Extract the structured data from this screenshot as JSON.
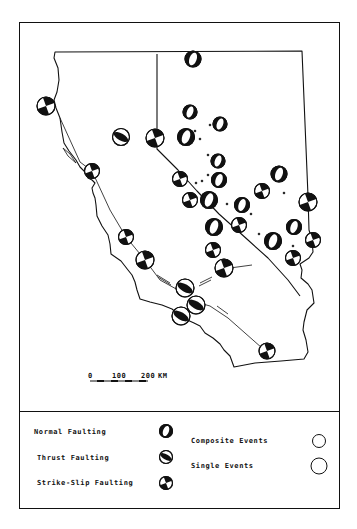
{
  "scale_bar": {
    "tick_0": "0",
    "tick_100": "100",
    "tick_200": "200",
    "unit": "KM"
  },
  "legend": {
    "mechanisms": [
      {
        "label": "Normal Faulting",
        "symbol": "normal"
      },
      {
        "label": "Thrust Faulting",
        "symbol": "thrust"
      },
      {
        "label": "Strike-Slip Faulting",
        "symbol": "strike-slip"
      }
    ],
    "event_types": [
      {
        "label": "Composite Events",
        "radius": 6.5
      },
      {
        "label": "Single Events",
        "radius": 8
      }
    ]
  },
  "colors": {
    "ink": "#111111",
    "paper": "#ffffff"
  },
  "map": {
    "regions": [
      "California",
      "Nevada"
    ],
    "events": [
      {
        "x": 193,
        "y": 59,
        "r": 8,
        "type": "normal"
      },
      {
        "x": 46,
        "y": 106,
        "r": 9,
        "type": "strike-slip"
      },
      {
        "x": 121,
        "y": 137,
        "r": 8.5,
        "type": "thrust"
      },
      {
        "x": 155,
        "y": 138,
        "r": 9,
        "type": "strike-slip"
      },
      {
        "x": 190,
        "y": 112,
        "r": 7,
        "type": "normal"
      },
      {
        "x": 220,
        "y": 124,
        "r": 7,
        "type": "normal"
      },
      {
        "x": 186,
        "y": 137,
        "r": 8.5,
        "type": "normal"
      },
      {
        "x": 218,
        "y": 161,
        "r": 7,
        "type": "normal"
      },
      {
        "x": 219,
        "y": 180,
        "r": 7.5,
        "type": "normal"
      },
      {
        "x": 180,
        "y": 179,
        "r": 7.5,
        "type": "strike-slip"
      },
      {
        "x": 92,
        "y": 171,
        "r": 7.5,
        "type": "strike-slip"
      },
      {
        "x": 279,
        "y": 174,
        "r": 8,
        "type": "normal"
      },
      {
        "x": 262,
        "y": 191,
        "r": 7.5,
        "type": "strike-slip"
      },
      {
        "x": 190,
        "y": 200,
        "r": 7.5,
        "type": "strike-slip"
      },
      {
        "x": 209,
        "y": 200,
        "r": 8.5,
        "type": "normal"
      },
      {
        "x": 242,
        "y": 205,
        "r": 7.5,
        "type": "normal"
      },
      {
        "x": 308,
        "y": 202,
        "r": 9,
        "type": "strike-slip"
      },
      {
        "x": 214,
        "y": 227,
        "r": 8.5,
        "type": "normal"
      },
      {
        "x": 239,
        "y": 225,
        "r": 7.5,
        "type": "strike-slip"
      },
      {
        "x": 294,
        "y": 227,
        "r": 7.5,
        "type": "normal"
      },
      {
        "x": 273,
        "y": 241,
        "r": 8.5,
        "type": "normal"
      },
      {
        "x": 313,
        "y": 240,
        "r": 7.5,
        "type": "strike-slip"
      },
      {
        "x": 293,
        "y": 258,
        "r": 7.5,
        "type": "strike-slip"
      },
      {
        "x": 126,
        "y": 237,
        "r": 7.5,
        "type": "strike-slip"
      },
      {
        "x": 213,
        "y": 250,
        "r": 7.5,
        "type": "strike-slip"
      },
      {
        "x": 145,
        "y": 260,
        "r": 9,
        "type": "strike-slip"
      },
      {
        "x": 224,
        "y": 268,
        "r": 9,
        "type": "strike-slip"
      },
      {
        "x": 185,
        "y": 288,
        "r": 9,
        "type": "thrust"
      },
      {
        "x": 196,
        "y": 305,
        "r": 9,
        "type": "thrust"
      },
      {
        "x": 181,
        "y": 316,
        "r": 9,
        "type": "thrust"
      },
      {
        "x": 267,
        "y": 351,
        "r": 8,
        "type": "strike-slip"
      }
    ]
  }
}
